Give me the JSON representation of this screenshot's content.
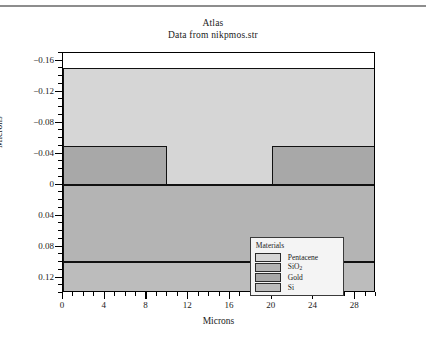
{
  "figure": {
    "title": "Atlas",
    "subtitle": "Data from nikpmos.str"
  },
  "chart_data": {
    "type": "area",
    "title": "Atlas",
    "subtitle": "Data from nikpmos.str",
    "xlabel": "Microns",
    "ylabel": "Microns",
    "xlim": [
      0,
      30
    ],
    "ylim": [
      0.14,
      -0.17
    ],
    "y_axis_inverted": true,
    "grid": false,
    "x_ticks": [
      0,
      4,
      8,
      12,
      16,
      20,
      24,
      28
    ],
    "x_tick_labels": [
      "0",
      "4",
      "8",
      "12",
      "16",
      "20",
      "24",
      "28"
    ],
    "x_minor_step": 1,
    "y_ticks": [
      -0.16,
      -0.12,
      -0.08,
      -0.04,
      0,
      0.04,
      0.08,
      0.12
    ],
    "y_tick_labels": [
      "−0.16",
      "−0.12",
      "−0.08",
      "−0.04",
      "0",
      "0.04",
      "0.08",
      "0.12"
    ],
    "y_minor_step": 0.01,
    "regions": [
      {
        "material": "Pentacene",
        "color": "#d6d6d6",
        "x_range": [
          0,
          30
        ],
        "y_range": [
          -0.15,
          0.0
        ]
      },
      {
        "material": "Gold",
        "color": "#a8a8a8",
        "x_range": [
          0,
          10
        ],
        "y_range": [
          -0.05,
          0.0
        ]
      },
      {
        "material": "Gold",
        "color": "#a8a8a8",
        "x_range": [
          20,
          30
        ],
        "y_range": [
          -0.05,
          0.0
        ]
      },
      {
        "material": "SiO2",
        "color": "#b4b4b4",
        "x_range": [
          0,
          30
        ],
        "y_range": [
          0.0,
          0.1
        ]
      },
      {
        "material": "Si",
        "color": "#bcbcbc",
        "x_range": [
          0,
          30
        ],
        "y_range": [
          0.1,
          0.14
        ]
      }
    ]
  },
  "legend": {
    "title": "Materials",
    "items": [
      {
        "label": "Pentacene",
        "color": "#d6d6d6"
      },
      {
        "label": "SiO",
        "sub": "2",
        "color": "#b4b4b4"
      },
      {
        "label": "Gold",
        "color": "#a8a8a8"
      },
      {
        "label": "Si",
        "color": "#bcbcbc"
      }
    ]
  },
  "axes": {
    "x_title": "Microns",
    "y_title": "Microns"
  }
}
